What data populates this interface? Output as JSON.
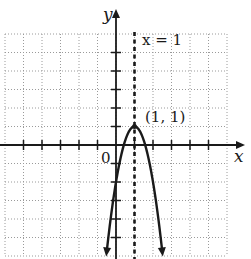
{
  "figure": {
    "type": "function-graph",
    "equation": "y = -3(x - 1)^2 + 1",
    "axes": {
      "x_label": "x",
      "y_label": "y",
      "origin_label": "0",
      "x_range": [
        -6,
        6
      ],
      "y_range": [
        -6,
        6
      ],
      "tick_step": 1,
      "grid": "dotted"
    },
    "axis_of_symmetry": {
      "label": "x = 1",
      "x": 1,
      "style": "dashed"
    },
    "vertex": {
      "label": "(1, 1)",
      "x": 1,
      "y": 1
    },
    "colors": {
      "ink": "#1a1a1a",
      "grid": "#9a9a9a",
      "background": "#ffffff"
    }
  },
  "chart_data": {
    "type": "line",
    "title": "",
    "xlabel": "x",
    "ylabel": "y",
    "xlim": [
      -6,
      6
    ],
    "ylim": [
      -6,
      6
    ],
    "grid": true,
    "series": [
      {
        "name": "y = -3(x-1)^2 + 1",
        "x": [
          -0.45,
          0,
          0.5,
          1,
          1.5,
          2,
          2.45
        ],
        "y": [
          -5.3,
          -2,
          0.25,
          1,
          0.25,
          -2,
          -5.3
        ]
      }
    ],
    "annotations": [
      {
        "text": "x = 1",
        "type": "vertical-dashed-line",
        "x": 1
      },
      {
        "text": "(1, 1)",
        "type": "point-label",
        "x": 1,
        "y": 1
      },
      {
        "text": "0",
        "type": "origin-label",
        "x": 0,
        "y": 0
      }
    ]
  }
}
